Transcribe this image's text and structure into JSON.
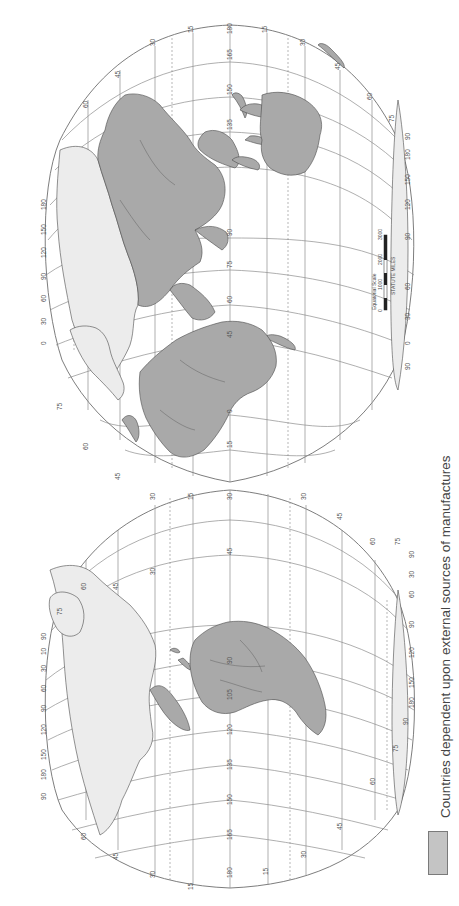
{
  "map": {
    "projection_orientation": "rotated 90deg clockwise (north to the left)",
    "colors": {
      "dependent_fill": "#a9a9a9",
      "independent_fill": "#ececec",
      "grid": "#8c8c8c",
      "background": "#ffffff"
    },
    "upper_lobe": {
      "equator_longitudes": [
        "180",
        "165",
        "150",
        "135",
        "90",
        "75",
        "60",
        "45",
        "0",
        "15",
        "30"
      ],
      "outer_latitudes_north": [
        "15",
        "30",
        "45",
        "60",
        "75",
        "90"
      ],
      "outer_latitudes_south": [
        "15",
        "30",
        "45",
        "60",
        "75",
        "90"
      ],
      "edge_longitudes_north": [
        "180",
        "150",
        "120",
        "90",
        "60",
        "30",
        "0",
        "30",
        "90"
      ],
      "edge_longitudes_south": [
        "90",
        "120",
        "150",
        "180",
        "90",
        "60",
        "30",
        "0",
        "90"
      ],
      "labels": {
        "top_lat_30": "30",
        "top_lat_45": "45",
        "top_lat_60": "60",
        "top_lat_15": "15",
        "lon_180": "180",
        "lon_0": "0",
        "lon_165": "165",
        "lon_150": "150",
        "lon_135": "135",
        "lon_90": "90",
        "lon_75": "75",
        "lon_60": "60",
        "lon_45": "45",
        "lon_0b": "0",
        "lon_15": "15",
        "s_lat_15": "15",
        "s_lat_30": "30",
        "s_lat_45": "45",
        "s_lat_60": "60",
        "s_lat_75": "75",
        "s_lat_90": "90",
        "s_lon_180": "180",
        "s_lon_150": "150",
        "s_lon_120": "120",
        "s_lon_90": "90",
        "s_lon_60": "60",
        "s_lon_30": "30",
        "s_lon_0": "0",
        "s_lon_90b": "90",
        "n_lon_90": "90",
        "n_lon_180": "180",
        "n_lon_150": "150",
        "n_lon_120": "120",
        "n_lon_90b": "90",
        "n_lon_60": "60",
        "n_lon_30": "30",
        "n_lon_0": "0",
        "n_lon_30b": "30",
        "n_lon_90c": "90",
        "n_lat_75": "75",
        "n_lat_60": "60",
        "n_lat_45": "45",
        "n_lat_30": "30",
        "n_lat_15": "15"
      }
    },
    "lower_lobe": {
      "labels": {
        "lon_30": "30",
        "lon_45": "45",
        "lon_90": "90",
        "lon_105": "105",
        "lon_120": "120",
        "lon_135": "135",
        "lon_150": "150",
        "lon_165": "165",
        "lon_180": "180",
        "lon_0": "0",
        "n_lat_60": "60",
        "n_lat_45": "45",
        "n_lat_30": "30",
        "n_lat_15": "15",
        "n_lat_75": "75",
        "n_lat_60b": "60",
        "n_lat_45b": "45",
        "n_lat_30b": "30",
        "n_lat_15b": "15",
        "n_lon_90": "90",
        "n_lon_10": "10",
        "n_lon_30": "30",
        "n_lon_60": "60",
        "n_lon_90b": "90",
        "n_lon_120": "120",
        "n_lon_150": "150",
        "n_lon_180": "180",
        "n_lon_90c": "90",
        "s_lat_15": "15",
        "s_lat_30": "30",
        "s_lat_45": "45",
        "s_lat_60": "60",
        "s_lat_75": "75",
        "s_lat_90": "90",
        "s_lat_75b": "75",
        "s_lat_60b": "60",
        "s_lat_45b": "45",
        "s_lat_30b": "30",
        "s_lat_15b": "15",
        "s_lon_90": "90",
        "s_lon_30": "30",
        "s_lon_60": "60",
        "s_lon_90b": "90",
        "s_lon_120": "120",
        "s_lon_150": "150",
        "s_lon_180": "180",
        "s_lon_90c": "90"
      }
    },
    "scale_bar": {
      "title": "Equatorial  Scale",
      "units": "STATUTE  MILES",
      "ticks": [
        "0",
        "1000",
        "2000",
        "3000"
      ]
    }
  },
  "legend": {
    "items": [
      {
        "swatch_color": "#c4c4c4",
        "label": "Countries dependent upon external sources of manufactures"
      }
    ]
  }
}
